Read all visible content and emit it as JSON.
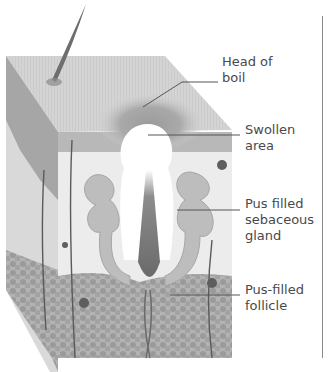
{
  "diagram": {
    "colors": {
      "surface": "#cfcfcf",
      "epidermis": "#a8a8a8",
      "dermis": "#e6e6e6",
      "fat": "#9a9a9a",
      "hair": "#6e6e6e",
      "pus": "#ffffff",
      "leader": "#555555",
      "divider": "#8a8a8a"
    },
    "labels": [
      {
        "lines": [
          "Head of",
          "boil"
        ]
      },
      {
        "lines": [
          "Swollen",
          "area"
        ]
      },
      {
        "lines": [
          "Pus filled",
          "sebaceous",
          "gland"
        ]
      },
      {
        "lines": [
          "Pus-filled",
          "follicle"
        ]
      }
    ]
  }
}
